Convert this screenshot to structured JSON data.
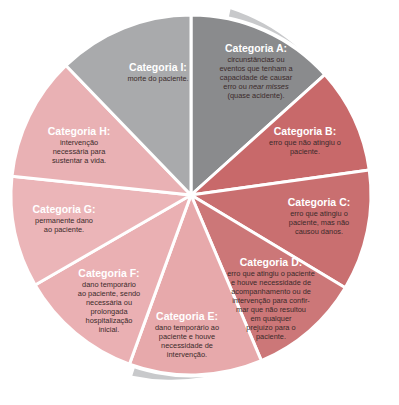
{
  "diagram": {
    "type": "pie-wheel",
    "center": [
      191,
      195
    ],
    "radius": 180,
    "ring": {
      "color": "#c8c9cb",
      "outer_radius": 190
    },
    "separator_color": "#ffffff",
    "categories": [
      {
        "id": "A",
        "title": "Categoria A:",
        "description": "circunstâncias ou eventos que tenham a capacidade de causar erro ou near misses (quase acidente).",
        "lines": [
          "circunstâncias ou",
          "eventos que tenham a",
          "capacidade de causar",
          "erro ou near misses",
          "(quase acidente)."
        ],
        "color": "#8a8b8d",
        "start_deg": -90,
        "end_deg": -42
      },
      {
        "id": "B",
        "title": "Categoria B:",
        "description": "erro que não atingiu o paciente.",
        "lines": [
          "erro que não atingiu o",
          "paciente."
        ],
        "color": "#c8696a",
        "start_deg": -42,
        "end_deg": -8
      },
      {
        "id": "C",
        "title": "Categoria C:",
        "description": "erro que atingiu o paciente, mas não causou danos.",
        "lines": [
          "erro que atingiu o",
          "paciente, mas não",
          "causou danos."
        ],
        "color": "#c96f70",
        "start_deg": -8,
        "end_deg": 31
      },
      {
        "id": "D",
        "title": "Categoria D:",
        "description": "erro que atingiu o paciente e houve necessidade de acompanhamento ou de intervenção para confirmar que não resultou em qualquer prejuízo para o paciente.",
        "lines": [
          "erro que atingiu o paciente",
          "e houve necessidade de",
          "acompanhamento ou de",
          "intervenção para confir-",
          "mar que não resultou",
          "em qualquer",
          "prejuízo para o",
          "paciente."
        ],
        "color": "#cc7778",
        "start_deg": 31,
        "end_deg": 67
      },
      {
        "id": "E",
        "title": "Categoria E:",
        "description": "dano temporário ao paciente e houve necessidade de intervenção.",
        "lines": [
          "dano temporário ao",
          "paciente e houve",
          "necessidade de",
          "intervenção."
        ],
        "color": "#e7a9ab",
        "start_deg": 67,
        "end_deg": 110
      },
      {
        "id": "F",
        "title": "Categoria F:",
        "description": "dano temporário ao paciente, sendo necessária ou prolongada hospitalização inicial.",
        "lines": [
          "dano temporário",
          "ao paciente, sendo",
          "necessária ou",
          "prolongada",
          "hospitalização",
          "inicial."
        ],
        "color": "#eab0b3",
        "start_deg": 110,
        "end_deg": 150
      },
      {
        "id": "G",
        "title": "Categoria G:",
        "description": "permanente dano ao paciente.",
        "lines": [
          "permanente dano",
          "ao paciente."
        ],
        "color": "#ebb5b8",
        "start_deg": 150,
        "end_deg": 186
      },
      {
        "id": "H",
        "title": "Categoria H:",
        "description": "intervenção necessária para sustentar a vida.",
        "lines": [
          "intervenção",
          "necessária para",
          "sustentar a vida."
        ],
        "color": "#e9b1b4",
        "start_deg": 186,
        "end_deg": 226
      },
      {
        "id": "I",
        "title": "Categoria I:",
        "description": "morte do paciente.",
        "lines": [
          "morte do paciente."
        ],
        "color": "#a9aaac",
        "start_deg": 226,
        "end_deg": 270
      }
    ]
  }
}
